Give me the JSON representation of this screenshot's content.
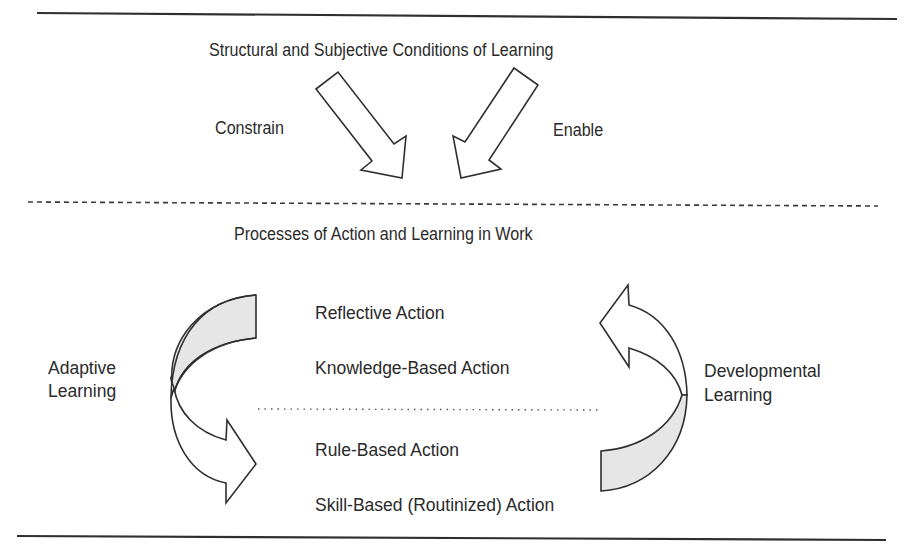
{
  "diagram": {
    "conditions_title": "Structural and Subjective Conditions of Learning",
    "arrows": {
      "left_label": "Constrain",
      "right_label": "Enable"
    },
    "processes_title": "Processes of Action and Learning in Work",
    "action_levels": {
      "upper": [
        "Reflective Action",
        "Knowledge-Based Action"
      ],
      "lower": [
        "Rule-Based Action",
        "Skill-Based (Routinized) Action"
      ]
    },
    "learning_cycles": {
      "left": {
        "line1": "Adaptive",
        "line2": "Learning",
        "direction": "downward"
      },
      "right": {
        "line1": "Developmental",
        "line2": "Learning",
        "direction": "upward"
      }
    },
    "colors": {
      "line": "#2f2f2f",
      "shade": "#e6e6e6",
      "text": "#2a2a2a"
    }
  }
}
